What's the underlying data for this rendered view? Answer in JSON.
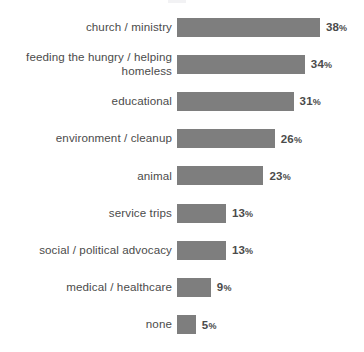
{
  "chart_data": {
    "type": "bar",
    "orientation": "horizontal",
    "title": "",
    "xlabel": "",
    "ylabel": "",
    "grid": false,
    "legend": null,
    "value_suffix": "%",
    "xlim": [
      0,
      38
    ],
    "bar_color": "#7e7e7e",
    "label_color": "#4b4b4b",
    "background": "#ffffff",
    "categories": [
      "church / ministry",
      "feeding the hungry / helping\nhomeless",
      "educational",
      "environment / cleanup",
      "animal",
      "service trips",
      "social / political advocacy",
      "medical / healthcare",
      "none"
    ],
    "values": [
      38,
      34,
      31,
      26,
      23,
      13,
      13,
      9,
      5
    ],
    "value_labels": [
      "38%",
      "34%",
      "31%",
      "26%",
      "23%",
      "13%",
      "13%",
      "9%",
      "5%"
    ]
  }
}
